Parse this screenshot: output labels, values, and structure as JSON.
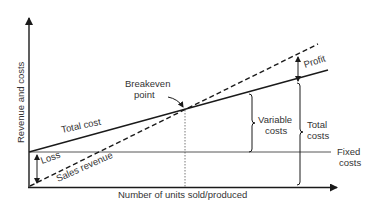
{
  "diagram": {
    "y_axis_label": "Revenue and costs",
    "x_axis_label": "Number of units sold/produced",
    "lines": {
      "total_cost": "Total cost",
      "sales_revenue": "Sales revenue",
      "fixed_costs": [
        "Fixed",
        "costs"
      ]
    },
    "annotations": {
      "breakeven": [
        "Breakeven",
        "point"
      ],
      "profit": "Profit",
      "loss": "Loss",
      "variable_costs": [
        "Variable",
        "costs"
      ],
      "total_costs": [
        "Total",
        "costs"
      ]
    },
    "colors": {
      "line": "#1a1a1a",
      "text": "#333333",
      "background": "#ffffff"
    }
  }
}
